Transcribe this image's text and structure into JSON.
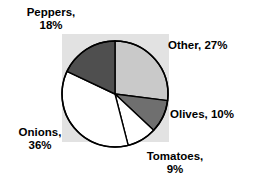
{
  "chart_data": {
    "type": "pie",
    "title": "",
    "subtitle": "",
    "xlabel": "",
    "ylabel": "",
    "legend_position": "none",
    "grid": false,
    "start_angle_deg": 90,
    "direction": "clockwise",
    "categories": [
      "Other",
      "Olives",
      "Tomatoes",
      "Onions",
      "Peppers"
    ],
    "values": [
      27,
      10,
      9,
      36,
      18
    ],
    "value_unit": "%",
    "colors": [
      "#c9c9c9",
      "#6f6f6f",
      "#ffffff",
      "#ffffff",
      "#4f4f4f"
    ],
    "slices": [
      {
        "name": "Other",
        "value": 27,
        "label": "Other, 27%",
        "label_lines": [
          "Other, 27%"
        ],
        "color": "#c9c9c9"
      },
      {
        "name": "Olives",
        "value": 10,
        "label": "Olives, 10%",
        "label_lines": [
          "Olives, 10%"
        ],
        "color": "#6f6f6f"
      },
      {
        "name": "Tomatoes",
        "value": 9,
        "label": "Tomatoes, 9%",
        "label_lines": [
          "Tomatoes,",
          "9%"
        ],
        "color": "#ffffff"
      },
      {
        "name": "Onions",
        "value": 36,
        "label": "Onions, 36%",
        "label_lines": [
          "Onions,",
          "36%"
        ],
        "color": "#ffffff"
      },
      {
        "name": "Peppers",
        "value": 18,
        "label": "Peppers, 18%",
        "label_lines": [
          "Peppers,",
          "18%"
        ],
        "color": "#4f4f4f"
      }
    ]
  },
  "style": {
    "plot_background": "#e2e2e2",
    "page_background": "#ffffff",
    "outline_color": "#000000",
    "text_color": "#000000"
  },
  "geometry": {
    "center_x": 115,
    "center_y": 94,
    "radius": 53
  }
}
